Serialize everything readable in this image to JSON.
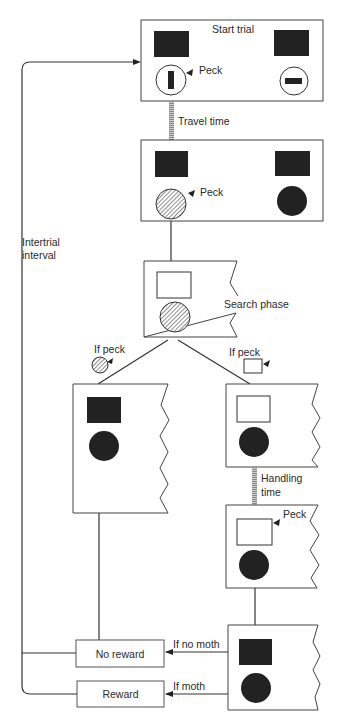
{
  "diagram": {
    "colors": {
      "ink": "#222222",
      "line": "#333333",
      "background": "#ffffff"
    },
    "nodes": {
      "start_trial": {
        "label": "Start trial",
        "peck_label": "Peck"
      },
      "after_travel": {
        "peck_label": "Peck"
      },
      "search": {
        "label": "Search phase"
      },
      "left_branch": {
        "if_label": "If peck"
      },
      "right_branch": {
        "if_label": "If peck"
      },
      "handling": {
        "peck_label": "Peck"
      },
      "outcome": {}
    },
    "edges": {
      "travel": {
        "label": "Travel time"
      },
      "handling": {
        "label_line1": "Handling",
        "label_line2": "time"
      },
      "intertrial": {
        "label_line1": "Intertrial",
        "label_line2": "interval"
      },
      "no_moth": {
        "label": "If no moth"
      },
      "moth": {
        "label": "If moth"
      }
    },
    "outcomes": {
      "no_reward": {
        "label": "No reward"
      },
      "reward": {
        "label": "Reward"
      }
    }
  }
}
